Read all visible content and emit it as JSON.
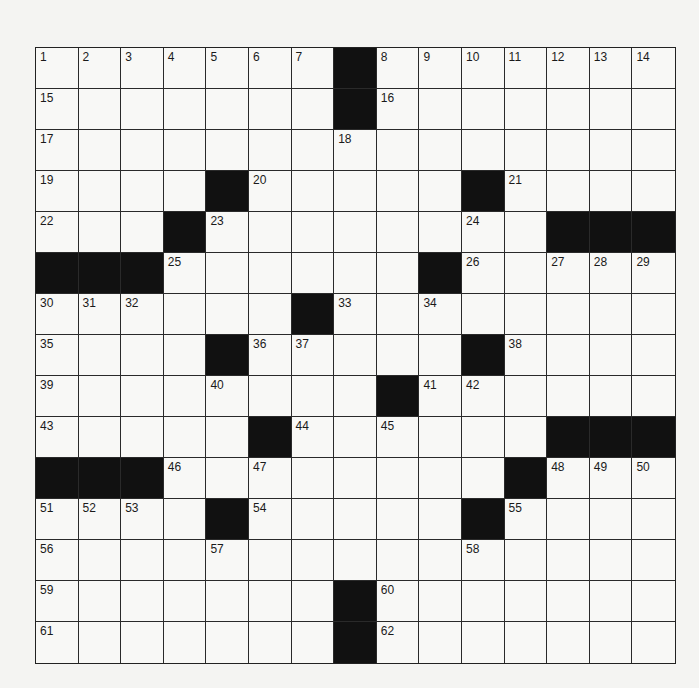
{
  "puzzle": {
    "rows": 15,
    "cols": 15,
    "colors": {
      "black": "#111111",
      "white": "#f8f8f6",
      "line": "#2a2a2a"
    },
    "layout": [
      "1234567#8901234",
      ".......#.......",
      "...............",
      "....#.....#....",
      "...#.......###",
      "###......#.....",
      "......#........",
      "....#.....#....",
      "........#......",
      ".....#......###",
      "###........#...",
      "....#.....#....",
      "...............",
      ".......#.......",
      ".......#......."
    ],
    "grid": [
      [
        "1",
        "2",
        "3",
        "4",
        "5",
        "6",
        "7",
        "#",
        "8",
        "9",
        "10",
        "11",
        "12",
        "13",
        "14"
      ],
      [
        "15",
        "",
        "",
        "",
        "",
        "",
        "",
        "#",
        "16",
        "",
        "",
        "",
        "",
        "",
        ""
      ],
      [
        "17",
        "",
        "",
        "",
        "",
        "",
        "",
        "18",
        "",
        "",
        "",
        "",
        "",
        "",
        ""
      ],
      [
        "19",
        "",
        "",
        "",
        "#",
        "20",
        "",
        "",
        "",
        "",
        "#",
        "21",
        "",
        "",
        ""
      ],
      [
        "22",
        "",
        "",
        "#",
        "23",
        "",
        "",
        "",
        "",
        "",
        "24",
        "",
        "#",
        "#",
        "#"
      ],
      [
        "#",
        "#",
        "#",
        "25",
        "",
        "",
        "",
        "",
        "",
        "#",
        "26",
        "",
        "27",
        "28",
        "29"
      ],
      [
        "30",
        "31",
        "32",
        "",
        "",
        "",
        "#",
        "33",
        "",
        "34",
        "",
        "",
        "",
        "",
        ""
      ],
      [
        "35",
        "",
        "",
        "",
        "#",
        "36",
        "37",
        "",
        "",
        "",
        "#",
        "38",
        "",
        "",
        ""
      ],
      [
        "39",
        "",
        "",
        "",
        "40",
        "",
        "",
        "",
        "#",
        "41",
        "42",
        "",
        "",
        "",
        ""
      ],
      [
        "43",
        "",
        "",
        "",
        "",
        "#",
        "44",
        "",
        "45",
        "",
        "",
        "",
        "#",
        "#",
        "#"
      ],
      [
        "#",
        "#",
        "#",
        "46",
        "",
        "47",
        "",
        "",
        "",
        "",
        "",
        "#",
        "48",
        "49",
        "50"
      ],
      [
        "51",
        "52",
        "53",
        "",
        "#",
        "54",
        "",
        "",
        "",
        "",
        "#",
        "55",
        "",
        "",
        ""
      ],
      [
        "56",
        "",
        "",
        "",
        "57",
        "",
        "",
        "",
        "",
        "",
        "58",
        "",
        "",
        "",
        ""
      ],
      [
        "59",
        "",
        "",
        "",
        "",
        "",
        "",
        "#",
        "60",
        "",
        "",
        "",
        "",
        "",
        ""
      ],
      [
        "61",
        "",
        "",
        "",
        "",
        "",
        "",
        "#",
        "62",
        "",
        "",
        "",
        "",
        "",
        ""
      ]
    ],
    "letters": []
  }
}
